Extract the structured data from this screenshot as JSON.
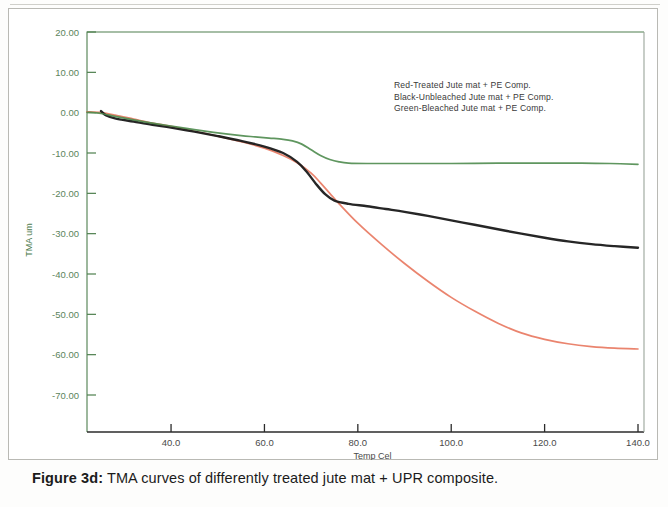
{
  "figure": {
    "label": "Figure 3d:",
    "caption": " TMA curves of differently treated jute mat + UPR composite."
  },
  "legend": {
    "items": [
      {
        "label": "Red-Treated Jute mat +  PE Comp.",
        "color": "#e8775e"
      },
      {
        "label": "Black-Unbleached Jute mat +  PE Comp.",
        "color": "#1a1a1a"
      },
      {
        "label": "Green-Bleached Jute mat + PE Comp.",
        "color": "#4e8b4e"
      }
    ]
  },
  "axes": {
    "x": {
      "label": "Temp Cel",
      "ticks": [
        "40.0",
        "60.0",
        "80.0",
        "100.0",
        "120.0",
        "140.0"
      ]
    },
    "y": {
      "label": "TMA um",
      "ticks": [
        "20.00",
        "10.00",
        "0.00",
        "-10.00",
        "-20.00",
        "-30.00",
        "-40.00",
        "-50.00",
        "-60.00",
        "-70.00"
      ]
    }
  },
  "chart_data": {
    "type": "line",
    "title": "",
    "xlabel": "Temp Cel",
    "ylabel": "TMA um",
    "xlim": [
      22,
      140
    ],
    "ylim": [
      -70,
      20
    ],
    "xticks": [
      40,
      60,
      80,
      100,
      120,
      140
    ],
    "yticks": [
      20,
      10,
      0,
      -10,
      -20,
      -30,
      -40,
      -50,
      -60,
      -70
    ],
    "grid": false,
    "legend_position": "upper-right-inside",
    "series": [
      {
        "name": "Red-Treated Jute mat +  PE Comp.",
        "color": "#e8775e",
        "x": [
          22,
          25,
          28,
          32,
          36,
          40,
          45,
          50,
          55,
          60,
          64,
          67,
          70,
          72,
          74,
          76,
          80,
          85,
          90,
          95,
          100,
          105,
          110,
          115,
          120,
          125,
          130,
          135,
          140
        ],
        "y": [
          0.2,
          0.0,
          -0.6,
          -1.6,
          -2.6,
          -3.4,
          -4.6,
          -5.8,
          -7.2,
          -8.8,
          -10.6,
          -12.4,
          -15.0,
          -17.4,
          -20.0,
          -22.6,
          -27.4,
          -32.6,
          -37.4,
          -41.8,
          -45.8,
          -49.2,
          -52.2,
          -54.6,
          -56.2,
          -57.3,
          -58.0,
          -58.4,
          -58.6
        ]
      },
      {
        "name": "Black-Unbleached Jute mat +  PE Comp.",
        "color": "#1a1a1a",
        "x": [
          25,
          26,
          28,
          32,
          36,
          40,
          45,
          50,
          55,
          60,
          64,
          67,
          69,
          71,
          73,
          75,
          78,
          82,
          86,
          90,
          95,
          100,
          105,
          110,
          115,
          120,
          125,
          130,
          135,
          140
        ],
        "y": [
          0.4,
          -0.6,
          -1.4,
          -2.2,
          -3.0,
          -3.7,
          -4.7,
          -5.8,
          -7.0,
          -8.4,
          -10.0,
          -12.2,
          -14.6,
          -17.6,
          -20.2,
          -21.8,
          -22.6,
          -23.2,
          -23.9,
          -24.6,
          -25.6,
          -26.7,
          -27.8,
          -28.9,
          -30.0,
          -31.0,
          -31.9,
          -32.6,
          -33.1,
          -33.5
        ]
      },
      {
        "name": "Green-Bleached Jute mat + PE Comp.",
        "color": "#4e8b4e",
        "x": [
          22,
          25,
          28,
          32,
          36,
          40,
          45,
          50,
          55,
          58,
          61,
          64,
          66,
          68,
          70,
          72,
          74,
          76,
          78,
          82,
          90,
          100,
          110,
          120,
          128,
          134,
          140
        ],
        "y": [
          0.1,
          -0.2,
          -0.9,
          -1.8,
          -2.6,
          -3.3,
          -4.2,
          -5.0,
          -5.7,
          -6.0,
          -6.3,
          -6.6,
          -7.0,
          -7.8,
          -9.2,
          -10.6,
          -11.6,
          -12.2,
          -12.5,
          -12.6,
          -12.6,
          -12.6,
          -12.5,
          -12.5,
          -12.5,
          -12.6,
          -12.8
        ]
      }
    ]
  }
}
